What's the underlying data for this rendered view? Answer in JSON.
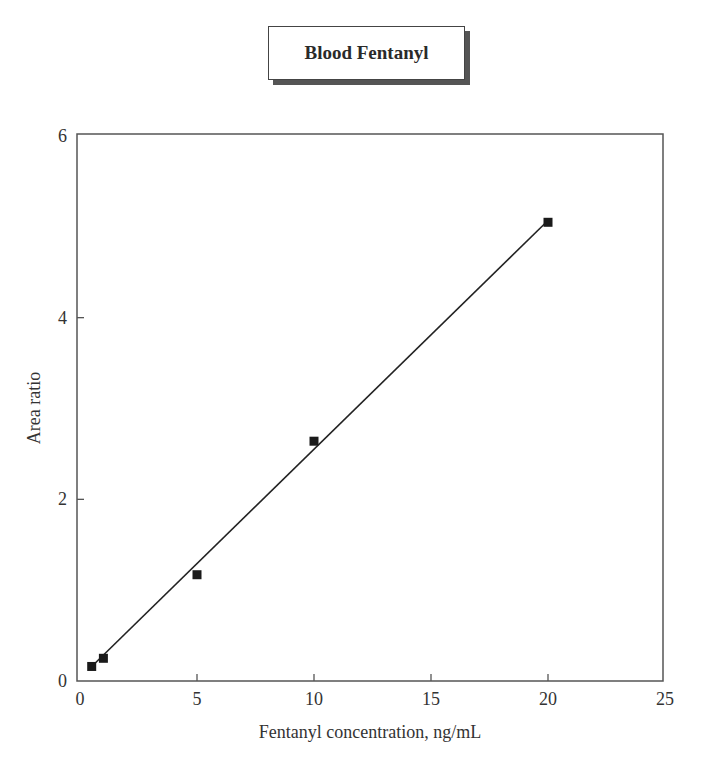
{
  "chart_data": {
    "type": "scatter",
    "title": "Blood Fentanyl",
    "xlabel": "Fentanyl concentration, ng/mL",
    "ylabel": "Area ratio",
    "xlim": [
      0,
      25
    ],
    "ylim": [
      0,
      6
    ],
    "xticks": [
      0,
      5,
      10,
      15,
      20,
      25
    ],
    "yticks": [
      0,
      2,
      4,
      6
    ],
    "grid": false,
    "legend": null,
    "series": [
      {
        "name": "Calibration points",
        "marker": "square",
        "x": [
          0.5,
          1,
          5,
          10,
          20
        ],
        "y": [
          0.16,
          0.25,
          1.17,
          2.64,
          5.05
        ]
      },
      {
        "name": "Linear fit",
        "type": "line",
        "x": [
          0.5,
          20
        ],
        "y": [
          0.16,
          5.07
        ]
      }
    ]
  }
}
